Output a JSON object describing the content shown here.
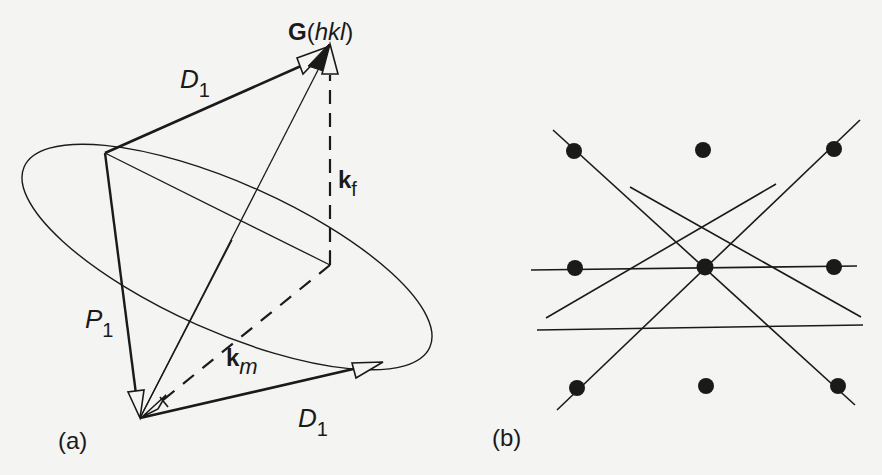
{
  "figure": {
    "panel_a": {
      "panel_label": "(a)",
      "apex_label": {
        "bold": "G",
        "paren_open": "(",
        "italic": "hkl",
        "paren_close": ")"
      },
      "vector_labels": {
        "d1_top": {
          "base": "D",
          "sub": "1"
        },
        "d1_bottom": {
          "base": "D",
          "sub": "1"
        },
        "p1": {
          "base": "P",
          "sub": "1"
        },
        "kf": {
          "base": "k",
          "sub": "f"
        },
        "km": {
          "base": "k",
          "sub": "m"
        }
      }
    },
    "panel_b": {
      "panel_label": "(b)",
      "lattice_rows": 3,
      "lattice_cols": 3
    },
    "colors": {
      "background": "#f4f4f2",
      "ink": "#1a1a1a"
    }
  }
}
